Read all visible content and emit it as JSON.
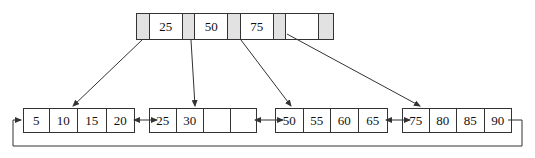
{
  "diagram": {
    "type": "B+ tree",
    "root": {
      "keys": [
        "25",
        "50",
        "75"
      ],
      "pointer_count": 4
    },
    "leaves": [
      {
        "keys": [
          "5",
          "10",
          "15",
          "20"
        ]
      },
      {
        "keys": [
          "25",
          "30",
          "",
          ""
        ]
      },
      {
        "keys": [
          "50",
          "55",
          "60",
          "65"
        ]
      },
      {
        "keys": [
          "75",
          "80",
          "85",
          "90"
        ]
      }
    ],
    "colors": {
      "line": "#333333",
      "pointer_cell": "#e2e2e2",
      "background": "#ffffff"
    }
  }
}
